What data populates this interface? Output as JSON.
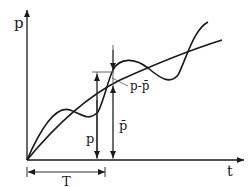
{
  "diagram": {
    "type": "function-plot",
    "axes": {
      "y_label": "p",
      "x_label": "t"
    },
    "curves": [
      {
        "name": "p",
        "description": "oscillating actual value"
      },
      {
        "name": "p_bar",
        "description": "mean trend (smooth, monotone)"
      }
    ],
    "annotations": {
      "p_marker": "p",
      "p_bar_marker": "p̄",
      "difference": "p-p̄",
      "period": "T"
    },
    "colors": {
      "stroke": "#1a1a1a",
      "guide": "#555555",
      "background": "#ffffff"
    }
  }
}
